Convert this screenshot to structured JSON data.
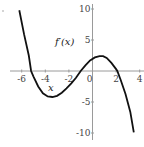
{
  "chart_data": {
    "type": "line",
    "title": "",
    "function_label": "f′(x)",
    "xlabel": "x",
    "ylabel": "f′(x)",
    "xlim": [
      -6.2,
      4
    ],
    "ylim": [
      -10,
      10
    ],
    "grid": false,
    "x_ticks": [
      -6,
      -4,
      -2,
      0,
      2,
      4
    ],
    "x_tick_labels": [
      "-6",
      "-4",
      "-2",
      "0",
      "2",
      "4"
    ],
    "y_ticks": [
      10,
      5,
      -5,
      -10
    ],
    "y_tick_labels": [
      "10",
      "5",
      "-5",
      "-10"
    ],
    "series": [
      {
        "name": "f′(x)",
        "x": [
          -6.2,
          -5.8,
          -5.4,
          -5.2,
          -5.0,
          -4.6,
          -4.2,
          -3.8,
          -3.4,
          -3.0,
          -2.6,
          -2.2,
          -1.8,
          -1.4,
          -1.0,
          -0.6,
          -0.2,
          0.2,
          0.6,
          0.9,
          1.2,
          1.6,
          2.0,
          2.1,
          2.4,
          2.8,
          3.2,
          3.5
        ],
        "y": [
          9.8,
          5.9,
          2.5,
          0.0,
          -0.9,
          -2.5,
          -3.6,
          -4.1,
          -4.2,
          -4.0,
          -3.5,
          -2.8,
          -2.0,
          -1.1,
          0.0,
          0.9,
          1.7,
          2.2,
          2.4,
          2.4,
          2.1,
          1.3,
          0.3,
          0.0,
          -1.5,
          -3.7,
          -6.6,
          -9.9
        ]
      }
    ],
    "roots": [
      -5.2,
      -1.0,
      2.1
    ],
    "local_min": {
      "x": -3.4,
      "y": -4.2
    },
    "local_max": {
      "x": 0.8,
      "y": 2.4
    }
  },
  "labels": {
    "function": "f′(x)",
    "x_axis": "x"
  },
  "mapping": {
    "x0_px": 92.5,
    "px_per_x": 11.8,
    "y0_px": 71,
    "px_per_y": 6.2
  }
}
